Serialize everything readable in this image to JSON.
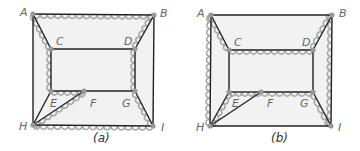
{
  "colors": {
    "background": "#ffffff",
    "fill": "#f2f2f2",
    "edge": "#222222",
    "highlight": "#a8a8a8",
    "vertex": "#999999",
    "label": "#666666"
  },
  "graphs": [
    {
      "caption": "(a)",
      "caption_pos": [
        93,
        142
      ],
      "vertices": {
        "A": [
          33,
          14
        ],
        "B": [
          154,
          15
        ],
        "C": [
          51,
          49
        ],
        "D": [
          135,
          49
        ],
        "E": [
          51,
          91
        ],
        "F": [
          84,
          91
        ],
        "G": [
          135,
          91
        ],
        "H": [
          33,
          125
        ],
        "I": [
          153,
          126
        ]
      },
      "labels": {
        "A": [
          20,
          16
        ],
        "B": [
          160,
          17
        ],
        "C": [
          56,
          45
        ],
        "D": [
          124,
          45
        ],
        "E": [
          50,
          107
        ],
        "F": [
          90,
          107
        ],
        "G": [
          122,
          107
        ],
        "H": [
          19,
          130
        ],
        "I": [
          161,
          131
        ]
      },
      "edges": [
        {
          "from": "A",
          "to": "B",
          "wavy": true
        },
        {
          "from": "A",
          "to": "C",
          "wavy": true
        },
        {
          "from": "A",
          "to": "H",
          "wavy": false
        },
        {
          "from": "B",
          "to": "D",
          "wavy": true
        },
        {
          "from": "B",
          "to": "I",
          "wavy": false
        },
        {
          "from": "C",
          "to": "D",
          "wavy": false
        },
        {
          "from": "C",
          "to": "E",
          "wavy": true
        },
        {
          "from": "D",
          "to": "G",
          "wavy": true
        },
        {
          "from": "E",
          "to": "F",
          "wavy": true
        },
        {
          "from": "F",
          "to": "G",
          "wavy": false
        },
        {
          "from": "E",
          "to": "H",
          "wavy": false
        },
        {
          "from": "H",
          "to": "F",
          "wavy": true
        },
        {
          "from": "G",
          "to": "I",
          "wavy": true
        },
        {
          "from": "H",
          "to": "I",
          "wavy": true
        }
      ]
    },
    {
      "caption": "(b)",
      "caption_pos": [
        271,
        142
      ],
      "vertices": {
        "A": [
          211,
          15
        ],
        "B": [
          332,
          15
        ],
        "C": [
          229,
          50
        ],
        "D": [
          313,
          50
        ],
        "E": [
          229,
          92
        ],
        "F": [
          261,
          92
        ],
        "G": [
          313,
          92
        ],
        "H": [
          210,
          126
        ],
        "I": [
          331,
          126
        ]
      },
      "labels": {
        "A": [
          197,
          17
        ],
        "B": [
          339,
          17
        ],
        "C": [
          234,
          46
        ],
        "D": [
          302,
          46
        ],
        "E": [
          232,
          107
        ],
        "F": [
          267,
          107
        ],
        "G": [
          300,
          107
        ],
        "H": [
          196,
          131
        ],
        "I": [
          338,
          131
        ]
      },
      "edges": [
        {
          "from": "A",
          "to": "B",
          "wavy": false
        },
        {
          "from": "A",
          "to": "C",
          "wavy": true
        },
        {
          "from": "A",
          "to": "H",
          "wavy": true
        },
        {
          "from": "B",
          "to": "D",
          "wavy": true
        },
        {
          "from": "B",
          "to": "I",
          "wavy": true
        },
        {
          "from": "C",
          "to": "D",
          "wavy": true
        },
        {
          "from": "C",
          "to": "E",
          "wavy": false
        },
        {
          "from": "D",
          "to": "G",
          "wavy": false
        },
        {
          "from": "E",
          "to": "F",
          "wavy": true
        },
        {
          "from": "F",
          "to": "G",
          "wavy": true
        },
        {
          "from": "H",
          "to": "E",
          "wavy": true
        },
        {
          "from": "H",
          "to": "F",
          "wavy": false
        },
        {
          "from": "G",
          "to": "I",
          "wavy": true
        },
        {
          "from": "H",
          "to": "I",
          "wavy": false
        }
      ]
    }
  ]
}
